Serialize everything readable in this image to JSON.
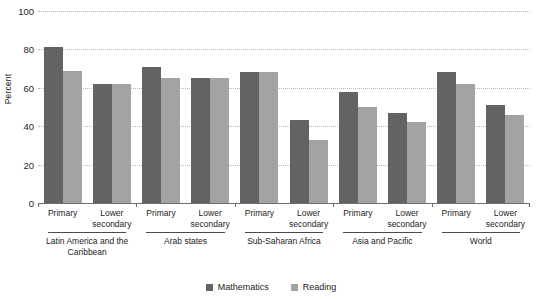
{
  "chart_data": {
    "type": "bar",
    "title": "",
    "subtitle": "",
    "xlabel": "",
    "ylabel": "Percent",
    "ylim": [
      0,
      100
    ],
    "yticks": [
      0,
      20,
      40,
      60,
      80,
      100
    ],
    "grid": "horizontal-dotted",
    "legend_position": "bottom-center",
    "categories": [
      "Latin America and the Caribbean — Primary",
      "Latin America and the Caribbean — Lower secondary",
      "Arab states — Primary",
      "Arab states — Lower secondary",
      "Sub-Saharan Africa — Primary",
      "Sub-Saharan Africa — Lower secondary",
      "Asia and Pacific — Primary",
      "Asia and Pacific — Lower secondary",
      "World — Primary",
      "World — Lower secondary"
    ],
    "series": [
      {
        "name": "Mathematics",
        "color": "#636363",
        "values": [
          81,
          62,
          71,
          65,
          68,
          43,
          58,
          47,
          68,
          51
        ]
      },
      {
        "name": "Reading",
        "color": "#a3a3a3",
        "values": [
          69,
          62,
          65,
          65,
          68,
          33,
          50,
          42,
          62,
          46
        ]
      }
    ],
    "regions": [
      {
        "name": "Latin America and the Caribbean",
        "levels": [
          "Primary",
          "Lower secondary"
        ]
      },
      {
        "name": "Arab states",
        "levels": [
          "Primary",
          "Lower secondary"
        ]
      },
      {
        "name": "Sub-Saharan Africa",
        "levels": [
          "Primary",
          "Lower secondary"
        ]
      },
      {
        "name": "Asia and Pacific",
        "levels": [
          "Primary",
          "Lower secondary"
        ]
      },
      {
        "name": "World",
        "levels": [
          "Primary",
          "Lower secondary"
        ]
      }
    ]
  },
  "axis": {
    "y_title": "Percent",
    "y_tick_labels": [
      "100",
      "80",
      "60",
      "40",
      "20",
      "0"
    ]
  },
  "legend": {
    "items": [
      {
        "label": "Mathematics",
        "color": "#636363"
      },
      {
        "label": "Reading",
        "color": "#a3a3a3"
      }
    ]
  },
  "sub_labels": [
    "Primary",
    "Lower secondary",
    "Primary",
    "Lower secondary",
    "Primary",
    "Lower secondary",
    "Primary",
    "Lower secondary",
    "Primary",
    "Lower secondary"
  ],
  "region_names": [
    "Latin America and the Caribbean",
    "Arab states",
    "Sub-Saharan Africa",
    "Asia and Pacific",
    "World"
  ],
  "colors": {
    "mathematics": "#636363",
    "reading": "#a3a3a3",
    "gridline": "#b9b9b9",
    "axis": "#6d6d6d",
    "text": "#1c1c1c",
    "background": "#ffffff"
  }
}
